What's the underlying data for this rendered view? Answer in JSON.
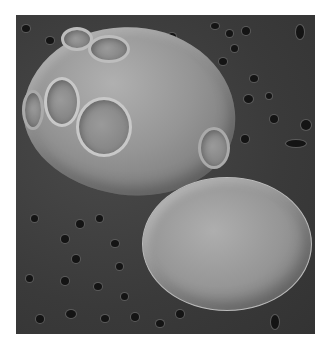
{
  "image": {
    "description": "Scanning electron micrograph of two yeast cells on a porous filter; the larger cell shows multiple bud scars",
    "colors": {
      "background": "#ffffff",
      "substrate": "#3c3c3c",
      "cell": "#969696",
      "pore": "#141414"
    }
  }
}
